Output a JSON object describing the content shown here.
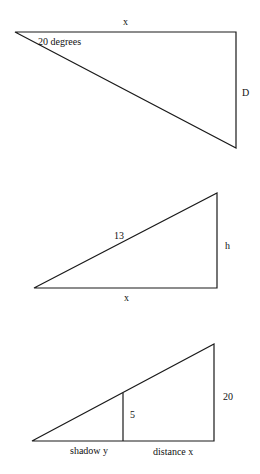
{
  "diagrams": [
    {
      "name": "triangle-1",
      "labels": {
        "top": "x",
        "angle": "20 degrees",
        "right": "D"
      }
    },
    {
      "name": "triangle-2",
      "labels": {
        "hypotenuse": "13",
        "right": "h",
        "bottom": "x"
      }
    },
    {
      "name": "triangle-3",
      "labels": {
        "inner_height": "5",
        "outer_height": "20",
        "shadow": "shadow y",
        "distance": "distance x"
      }
    }
  ],
  "colors": {
    "stroke": "#1a1a1a",
    "background": "#ffffff"
  }
}
